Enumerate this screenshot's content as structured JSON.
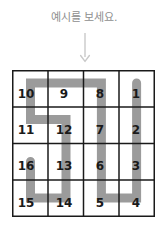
{
  "instruction": {
    "text": "예시를 보세요."
  },
  "arrow": {
    "icon": "arrow-down-icon",
    "color": "#c9c9c9"
  },
  "colors": {
    "grid_line": "#1a1a1a",
    "path": "#9b9b9b",
    "number": "#1a1a1a",
    "instruction_text": "#8e8e8e",
    "background": "#ffffff"
  },
  "puzzle": {
    "type": "snake-path-grid",
    "rows": 4,
    "cols": 4,
    "cells": [
      [
        {
          "label": "10",
          "row": 0,
          "col": 0
        },
        {
          "label": "9",
          "row": 0,
          "col": 1
        },
        {
          "label": "8",
          "row": 0,
          "col": 2
        },
        {
          "label": "1",
          "row": 0,
          "col": 3
        }
      ],
      [
        {
          "label": "11",
          "row": 1,
          "col": 0
        },
        {
          "label": "12",
          "row": 1,
          "col": 1
        },
        {
          "label": "7",
          "row": 1,
          "col": 2
        },
        {
          "label": "2",
          "row": 1,
          "col": 3
        }
      ],
      [
        {
          "label": "16",
          "row": 2,
          "col": 0
        },
        {
          "label": "13",
          "row": 2,
          "col": 1
        },
        {
          "label": "6",
          "row": 2,
          "col": 2
        },
        {
          "label": "3",
          "row": 2,
          "col": 3
        }
      ],
      [
        {
          "label": "15",
          "row": 3,
          "col": 0
        },
        {
          "label": "14",
          "row": 3,
          "col": 1
        },
        {
          "label": "5",
          "row": 3,
          "col": 2
        },
        {
          "label": "4",
          "row": 3,
          "col": 3
        }
      ]
    ],
    "path_order": [
      "1",
      "2",
      "3",
      "4",
      "5",
      "6",
      "7",
      "8",
      "9",
      "10",
      "11",
      "12",
      "13",
      "14",
      "15",
      "16"
    ],
    "path_points": [
      {
        "col": 3,
        "row": 0
      },
      {
        "col": 3,
        "row": 3
      },
      {
        "col": 2,
        "row": 3
      },
      {
        "col": 2,
        "row": 0
      },
      {
        "col": 0,
        "row": 0
      },
      {
        "col": 0,
        "row": 1
      },
      {
        "col": 1,
        "row": 1
      },
      {
        "col": 1,
        "row": 3
      },
      {
        "col": 0,
        "row": 3
      },
      {
        "col": 0,
        "row": 2
      }
    ]
  }
}
